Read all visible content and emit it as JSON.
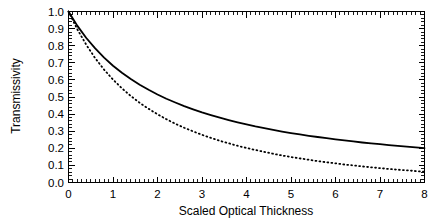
{
  "chart_data": {
    "type": "line",
    "title": "",
    "xlabel": "Scaled Optical Thickness",
    "ylabel": "Transmissivity",
    "xlim": [
      0,
      8
    ],
    "ylim": [
      0.0,
      1.0
    ],
    "grid": false,
    "legend": "none",
    "xticks": [
      0,
      1,
      2,
      3,
      4,
      5,
      6,
      7,
      8
    ],
    "xtick_labels": [
      "0",
      "1",
      "2",
      "3",
      "4",
      "5",
      "6",
      "7",
      "8"
    ],
    "x_minor_tick_step": 0.1,
    "yticks": [
      0.0,
      0.1,
      0.2,
      0.3,
      0.4,
      0.5,
      0.6,
      0.7,
      0.8,
      0.9,
      1.0
    ],
    "ytick_labels": [
      "0.0",
      "0.1",
      "0.2",
      "0.3",
      "0.4",
      "0.5",
      "0.6",
      "0.7",
      "0.8",
      "0.9",
      "1.0"
    ],
    "y_minor_tick_step": 0.02,
    "x": [
      0.0,
      0.2,
      0.4,
      0.6,
      0.8,
      1.0,
      1.2,
      1.4,
      1.6,
      1.8,
      2.0,
      2.2,
      2.4,
      2.6,
      2.8,
      3.0,
      3.2,
      3.4,
      3.6,
      3.8,
      4.0,
      4.2,
      4.4,
      4.6,
      4.8,
      5.0,
      5.2,
      5.4,
      5.6,
      5.8,
      6.0,
      6.2,
      6.4,
      6.6,
      6.8,
      7.0,
      7.2,
      7.4,
      7.6,
      7.8,
      8.0
    ],
    "series": [
      {
        "name": "solid-curve",
        "style": "solid",
        "color": "#000000",
        "values": [
          1.0,
          0.916,
          0.845,
          0.784,
          0.73,
          0.683,
          0.642,
          0.605,
          0.572,
          0.542,
          0.515,
          0.49,
          0.468,
          0.447,
          0.428,
          0.41,
          0.394,
          0.379,
          0.365,
          0.352,
          0.34,
          0.328,
          0.318,
          0.308,
          0.298,
          0.289,
          0.281,
          0.273,
          0.266,
          0.259,
          0.252,
          0.246,
          0.24,
          0.234,
          0.229,
          0.224,
          0.219,
          0.214,
          0.21,
          0.205,
          0.201
        ]
      },
      {
        "name": "dotted-curve",
        "style": "dotted",
        "color": "#000000",
        "values": [
          1.0,
          0.895,
          0.805,
          0.727,
          0.66,
          0.602,
          0.551,
          0.506,
          0.466,
          0.431,
          0.399,
          0.37,
          0.344,
          0.32,
          0.299,
          0.279,
          0.261,
          0.244,
          0.229,
          0.215,
          0.202,
          0.19,
          0.179,
          0.168,
          0.158,
          0.149,
          0.141,
          0.133,
          0.125,
          0.118,
          0.112,
          0.105,
          0.1,
          0.094,
          0.089,
          0.084,
          0.079,
          0.075,
          0.071,
          0.067,
          0.063
        ]
      }
    ]
  },
  "axes": {
    "y_title": "Transmissivity",
    "x_title": "Scaled Optical Thickness"
  },
  "colors": {
    "background": "#ffffff",
    "foreground": "#000000"
  }
}
